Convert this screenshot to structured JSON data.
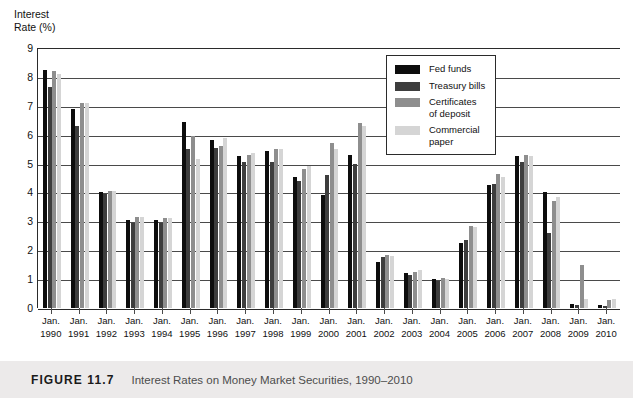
{
  "figure": {
    "number_label": "FIGURE 11.7",
    "caption": "Interest Rates on Money Market Securities, 1990–2010"
  },
  "axis": {
    "y_title": "Interest\nRate (%)",
    "y_ticks": [
      "9",
      "8",
      "7",
      "6",
      "5",
      "4",
      "3",
      "2",
      "1",
      "0"
    ]
  },
  "legend": {
    "items": [
      {
        "label": "Fed funds",
        "color": "#0d0d0d"
      },
      {
        "label": "Treasury bills",
        "color": "#3d3d3d"
      },
      {
        "label": "Certificates\nof deposit",
        "color": "#8e8e8e"
      },
      {
        "label": "Commercial\npaper",
        "color": "#d5d5d5"
      }
    ]
  },
  "chart_data": {
    "type": "bar",
    "title": "Interest Rates on Money Market Securities, 1990–2010",
    "xlabel": "",
    "ylabel": "Interest Rate (%)",
    "ylim": [
      0,
      9
    ],
    "ytick_step": 1,
    "grid": true,
    "legend_position": "inside-top-right",
    "categories": [
      "Jan.\n1990",
      "Jan.\n1991",
      "Jan.\n1992",
      "Jan.\n1993",
      "Jan.\n1994",
      "Jan.\n1995",
      "Jan.\n1996",
      "Jan.\n1997",
      "Jan.\n1998",
      "Jan.\n1999",
      "Jan.\n2000",
      "Jan.\n2001",
      "Jan.\n2002",
      "Jan.\n2003",
      "Jan.\n2004",
      "Jan.\n2005",
      "Jan.\n2006",
      "Jan.\n2007",
      "Jan.\n2008",
      "Jan.\n2009",
      "Jan.\n2010"
    ],
    "series": [
      {
        "name": "Fed funds",
        "color": "#0d0d0d",
        "values": [
          8.25,
          6.9,
          4.0,
          3.05,
          3.05,
          6.45,
          5.8,
          5.25,
          5.45,
          4.55,
          3.9,
          5.3,
          1.6,
          1.2,
          1.0,
          2.25,
          4.25,
          5.25,
          4.0,
          0.15,
          0.12
        ]
      },
      {
        "name": "Treasury bills",
        "color": "#3d3d3d",
        "values": [
          7.65,
          6.3,
          3.95,
          2.95,
          2.95,
          5.5,
          5.55,
          5.05,
          5.05,
          4.4,
          4.6,
          5.0,
          1.75,
          1.15,
          0.95,
          2.35,
          4.3,
          5.05,
          2.6,
          0.1,
          0.08
        ]
      },
      {
        "name": "Certificates of deposit",
        "color": "#8e8e8e",
        "values": [
          8.2,
          7.1,
          4.05,
          3.15,
          3.1,
          5.95,
          5.6,
          5.3,
          5.5,
          4.8,
          5.7,
          6.4,
          1.85,
          1.25,
          1.05,
          2.85,
          4.65,
          5.3,
          3.7,
          1.5,
          0.28
        ]
      },
      {
        "name": "Commercial paper",
        "color": "#d5d5d5",
        "values": [
          8.1,
          7.1,
          4.05,
          3.15,
          3.1,
          5.15,
          5.9,
          5.35,
          5.5,
          4.9,
          5.5,
          6.3,
          1.8,
          1.3,
          1.0,
          2.8,
          4.55,
          5.25,
          3.85,
          0.3,
          0.3
        ]
      }
    ]
  }
}
